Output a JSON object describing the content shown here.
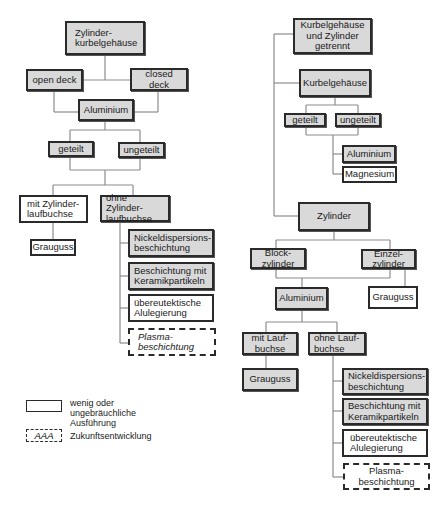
{
  "diagram": {
    "left_tree": {
      "root": "Zylinder-\nkurbelgehäuse",
      "open_deck": "open deck",
      "closed_deck": "closed deck",
      "aluminium": "Aluminium",
      "geteilt": "geteilt",
      "ungeteilt": "ungeteilt",
      "mit_laufbuchse": "mit Zylinder-\nlaufbuchse",
      "ohne_laufbuchse": "ohne Zylinder-\nlaufbuchse",
      "grauguss": "Grauguss",
      "options": [
        {
          "label": "Nickeldispersions-\nbeschichtung",
          "style": "gray"
        },
        {
          "label": "Beschichtung mit\nKeramikpartikeln",
          "style": "gray"
        },
        {
          "label": "übereutektische\nAlulegierung",
          "style": "white"
        },
        {
          "label": "Plasma-\nbeschichtung",
          "style": "dashed"
        }
      ]
    },
    "right_tree": {
      "root": "Kurbelgehäuse\nund Zylinder\ngetrennt",
      "kurbelgehaeuse": "Kurbelgehäuse",
      "geteilt": "geteilt",
      "ungeteilt": "ungeteilt",
      "materials": [
        {
          "label": "Aluminium",
          "style": "gray"
        },
        {
          "label": "Magnesium",
          "style": "white"
        }
      ],
      "zylinder": "Zylinder",
      "blockzylinder": "Block-\nzylinder",
      "einzelzylinder": "Einzel-\nzylinder",
      "aluminium": "Aluminium",
      "grauguss_einzel": "Grauguss",
      "mit_laufbuchse": "mit Lauf-\nbuchse",
      "ohne_laufbuchse": "ohne Lauf-\nbuchse",
      "grauguss": "Grauguss",
      "options": [
        {
          "label": "Nickeldispersions-\nbeschichtung",
          "style": "gray"
        },
        {
          "label": "Beschichtung mit\nKeramikpartikeln",
          "style": "gray"
        },
        {
          "label": "übereutektische\nAlulegierung",
          "style": "white"
        },
        {
          "label": "Plasma-\nbeschichtung",
          "style": "dashed"
        }
      ]
    },
    "legend": {
      "items": [
        {
          "symbol": "",
          "label": "wenig oder\nungebräuchliche\nAusführung"
        },
        {
          "symbol": "AAA",
          "label": "Zukunftsentwicklung"
        }
      ]
    },
    "colors": {
      "common_fill": "#d9d9d9",
      "rare_fill": "#ffffff",
      "border": "#2a2a2a",
      "connector": "#8c8c8c"
    }
  }
}
